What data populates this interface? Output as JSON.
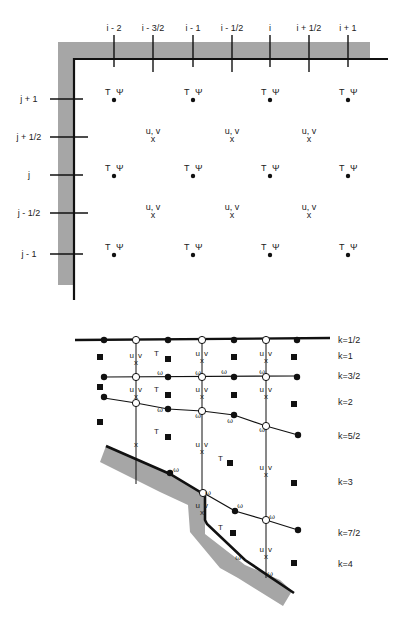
{
  "top_diagram": {
    "description": "Staggered horizontal grid (Arakawa-type) near a coastline corner",
    "i_labels": [
      "i - 2",
      "i - 3/2",
      "i - 1",
      "i - 1/2",
      "i",
      "i + 1/2",
      "i + 1"
    ],
    "j_labels": [
      "j + 1",
      "j + 1/2",
      "j",
      "j - 1/2",
      "j - 1"
    ],
    "scalar_point_label_T": "T",
    "scalar_point_label_psi": "Ψ",
    "velocity_point_label": "u, v",
    "velocity_marker": "x",
    "scalar_rows": [
      "j + 1",
      "j",
      "j - 1"
    ],
    "scalar_cols": [
      "i - 2",
      "i - 1",
      "i",
      "i + 1"
    ],
    "velocity_rows": [
      "j + 1/2",
      "j - 1/2"
    ],
    "velocity_cols": [
      "i - 3/2",
      "i - 1/2",
      "i + 1/2"
    ],
    "colors": {
      "land": "#a6a6a6",
      "boundary": "#111111"
    }
  },
  "bottom_diagram": {
    "description": "Vertical sigma-like level grid over sloping bottom topography",
    "k_labels": [
      "k=1/2",
      "k=1",
      "k=3/2",
      "k=2",
      "k=5/2",
      "k=3",
      "k=7/2",
      "k=4"
    ],
    "T_label": "T",
    "uv_label_u": "u",
    "uv_label_v": "v",
    "omega_label": "ω",
    "colors": {
      "land": "#a6a6a6",
      "line": "#111111"
    }
  }
}
